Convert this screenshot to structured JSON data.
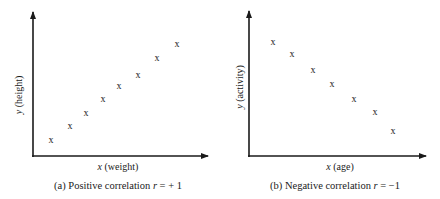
{
  "chart_data": [
    {
      "type": "scatter",
      "panel": "a",
      "caption": "(a) Positive correlation r = + 1",
      "caption_parts": {
        "prefix": "(a) Positive correlation ",
        "var": "r",
        "suffix": " = + 1"
      },
      "xlabel": "x (weight)",
      "xlabel_parts": {
        "var": "x",
        "rest": " (weight)"
      },
      "ylabel": "y (height)",
      "ylabel_parts": {
        "var": "y",
        "rest": " (height)"
      },
      "marker": "x",
      "grid": false,
      "ticks": false,
      "correlation": 1,
      "x": [
        1,
        2,
        3,
        4,
        5,
        6,
        7,
        8
      ],
      "y": [
        1,
        2,
        3,
        4,
        5,
        6,
        7,
        8
      ],
      "pixel_points": [
        [
          51,
          140
        ],
        [
          70,
          126
        ],
        [
          86,
          113
        ],
        [
          103,
          99
        ],
        [
          119,
          86
        ],
        [
          138,
          75
        ],
        [
          157,
          58
        ],
        [
          177,
          44
        ]
      ]
    },
    {
      "type": "scatter",
      "panel": "b",
      "caption": "(b) Negative correlation r = −1",
      "caption_parts": {
        "prefix": "(b) Negative correlation ",
        "var": "r",
        "suffix": " = −1"
      },
      "xlabel": "x (age)",
      "xlabel_parts": {
        "var": "x",
        "rest": " (age)"
      },
      "ylabel": "y (activity)",
      "ylabel_parts": {
        "var": "y",
        "rest": " (activity)"
      },
      "marker": "x",
      "grid": false,
      "ticks": false,
      "correlation": -1,
      "x": [
        1,
        2,
        3,
        4,
        5,
        6,
        7
      ],
      "y": [
        7,
        6,
        5,
        4,
        3,
        2,
        1
      ],
      "pixel_points": [
        [
          273,
          42
        ],
        [
          292,
          54
        ],
        [
          313,
          70
        ],
        [
          332,
          84
        ],
        [
          354,
          99
        ],
        [
          375,
          112
        ],
        [
          393,
          131
        ]
      ]
    }
  ],
  "colors": {
    "ink": "#1a1a1a",
    "background": "#ffffff"
  }
}
